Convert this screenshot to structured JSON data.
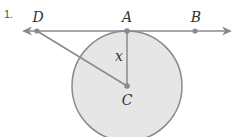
{
  "problem": {
    "number": "1."
  },
  "diagram": {
    "points": {
      "D": {
        "label": "D"
      },
      "A": {
        "label": "A"
      },
      "B": {
        "label": "B"
      },
      "C": {
        "label": "C"
      }
    },
    "segment_label": "x",
    "colors": {
      "stroke": "#8a8a8a",
      "circle_fill": "#e6e6e6",
      "point": "#8a8a8a",
      "text": "#333333"
    }
  }
}
